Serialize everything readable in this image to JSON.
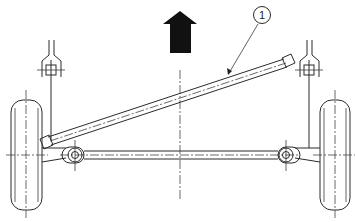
{
  "diagram": {
    "direction_arrow": {
      "meaning": "forward-direction",
      "color": "#111111"
    },
    "callouts": [
      {
        "number": "1",
        "target": "lateral-rod"
      }
    ],
    "components": [
      "left-wheel",
      "right-wheel",
      "left-strut-mount",
      "right-strut-mount",
      "lateral-rod",
      "axle-beam",
      "left-pivot",
      "right-pivot",
      "vehicle-centerline"
    ],
    "colors": {
      "line": "#2a2a2a",
      "background": "#ffffff",
      "arrow": "#111111"
    }
  }
}
